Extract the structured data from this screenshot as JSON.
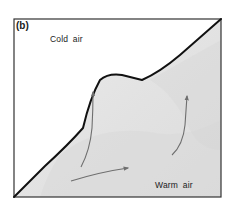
{
  "figure": {
    "panel_label": "(b)",
    "regions": {
      "cold": {
        "label": "Cold air",
        "fill": "#ffffff"
      },
      "warm": {
        "label": "Warm air",
        "fill": "#e3e3e3"
      }
    },
    "colors": {
      "frame": "#333333",
      "front_line": "#111111",
      "arrow": "#6e6e6e",
      "warm_shade_light": "#ebebeb",
      "warm_shade_dark": "#d6d6d6"
    },
    "arrows": [
      {
        "name": "rising-arrow-left",
        "direction": "up"
      },
      {
        "name": "rising-arrow-right",
        "direction": "up"
      },
      {
        "name": "horizontal-arrow-bottom",
        "direction": "right"
      }
    ]
  }
}
